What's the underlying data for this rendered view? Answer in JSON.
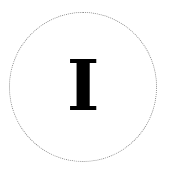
{
  "badge": {
    "letter": "I",
    "border_color": "#8a8a8a",
    "text_color": "#000000"
  }
}
